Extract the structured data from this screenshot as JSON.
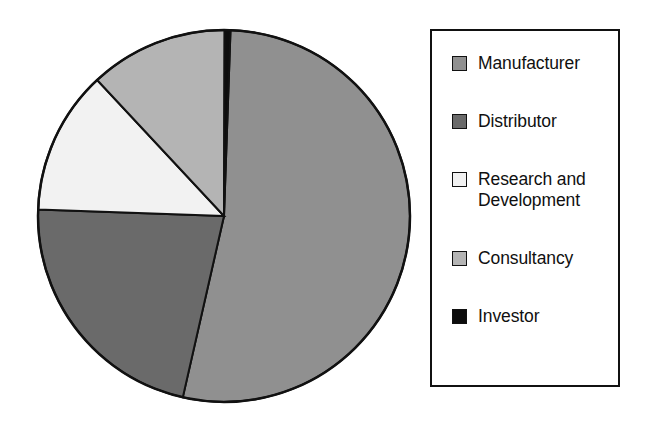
{
  "chart_data": {
    "type": "pie",
    "title": "",
    "subtitle": "",
    "xlabel": "",
    "ylabel": "",
    "grid": false,
    "legend_position": "right",
    "start_angle_deg": -90,
    "direction": "clockwise",
    "categories": [
      "Manufacturer",
      "Distributor",
      "Research and Development",
      "Consultancy",
      "Investor"
    ],
    "values": [
      53.0,
      22.0,
      12.5,
      12.0,
      0.5
    ],
    "units": "percent",
    "slices": [
      {
        "label": "Manufacturer",
        "value": 53.0,
        "angle_deg": 190.8,
        "color": "#909090",
        "start_deg": -88,
        "end_deg": 102.8
      },
      {
        "label": "Distributor",
        "value": 22.0,
        "angle_deg": 79.2,
        "color": "#6a6a6a",
        "start_deg": 102.8,
        "end_deg": 182.0
      },
      {
        "label": "Research and Development",
        "value": 12.5,
        "angle_deg": 45.0,
        "color": "#f2f2f2",
        "start_deg": 182.0,
        "end_deg": 227.0
      },
      {
        "label": "Consultancy",
        "value": 12.0,
        "angle_deg": 43.2,
        "color": "#b4b4b4",
        "start_deg": 227.0,
        "end_deg": 270.2
      },
      {
        "label": "Investor",
        "value": 0.5,
        "angle_deg": 1.8,
        "color": "#0d0d0d",
        "start_deg": 270.2,
        "end_deg": 272.0
      }
    ],
    "outline_color": "#111111"
  },
  "legend": {
    "border_color": "#111111",
    "items": [
      {
        "label": "Manufacturer",
        "swatch": "#909090",
        "swatch_name": "legend-swatch-manufacturer"
      },
      {
        "label": "Distributor",
        "swatch": "#6a6a6a",
        "swatch_name": "legend-swatch-distributor"
      },
      {
        "label": "Research and\nDevelopment",
        "swatch": "#f2f2f2",
        "swatch_name": "legend-swatch-research-and-development"
      },
      {
        "label": "Consultancy",
        "swatch": "#b4b4b4",
        "swatch_name": "legend-swatch-consultancy"
      },
      {
        "label": "Investor",
        "swatch": "#0d0d0d",
        "swatch_name": "legend-swatch-investor"
      }
    ]
  }
}
